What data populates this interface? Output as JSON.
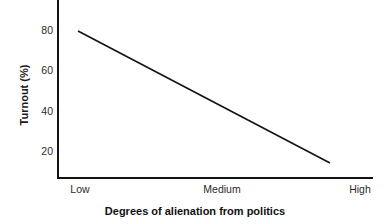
{
  "chart_data": {
    "type": "line",
    "title": "",
    "xlabel": "Degrees of alienation from politics",
    "ylabel": "Turnout (%)",
    "categories": [
      "Low",
      "Medium",
      "High"
    ],
    "x": [
      0,
      1,
      2
    ],
    "series": [
      {
        "name": "Turnout",
        "values": [
          80,
          47,
          14
        ]
      }
    ],
    "x_tick_labels": [
      "Low",
      "Medium",
      "High"
    ],
    "y_tick_labels": [
      "80",
      "60",
      "40",
      "20"
    ],
    "y_ticks": [
      80,
      60,
      40,
      20
    ],
    "ylim": [
      0,
      88
    ],
    "xlim": [
      0,
      2.17
    ],
    "grid": false,
    "legend": false,
    "legend_position": "none",
    "annotations": [],
    "line_color": "#141414",
    "axis_color": "#121212",
    "background_color": "#ffffff"
  },
  "axes": {
    "y_title": "Turnout (%)",
    "x_title": "Degrees of alienation from politics",
    "y_ticks": [
      {
        "label": "80",
        "top": 24
      },
      {
        "label": "60",
        "top": 64
      },
      {
        "label": "40",
        "top": 105
      },
      {
        "label": "20",
        "top": 145
      }
    ],
    "x_ticks": [
      {
        "label": "Low",
        "left": 80
      },
      {
        "label": "Medium",
        "left": 222
      },
      {
        "label": "High",
        "left": 360
      }
    ]
  },
  "line_geometry": {
    "x1": 78,
    "y1": 31,
    "x2": 330,
    "y2": 163
  }
}
